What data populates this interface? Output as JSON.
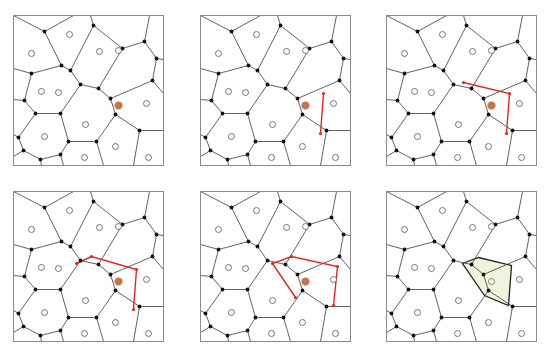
{
  "figure": {
    "panel_size": 150,
    "colors": {
      "frame": "#8a8a8a",
      "edge": "#3a3a3a",
      "vertex": "#111111",
      "site_stroke": "#555555",
      "site_fill": "#ffffff",
      "new_site_fill": "#c9794a",
      "new_site_ring": "#e8b99a",
      "trace": "#e0281e",
      "new_cell_fill": "#eef5dc",
      "new_cell_stroke": "#222222"
    }
  },
  "base": {
    "vertices": [
      [
        31,
        16
      ],
      [
        80,
        10
      ],
      [
        48,
        50
      ],
      [
        57,
        55
      ],
      [
        18,
        58
      ],
      [
        109,
        33
      ],
      [
        131,
        26
      ],
      [
        143,
        43
      ],
      [
        139,
        65
      ],
      [
        67,
        69
      ],
      [
        85,
        73
      ],
      [
        97,
        83
      ],
      [
        11,
        85
      ],
      [
        22,
        98
      ],
      [
        47,
        98
      ],
      [
        102,
        99
      ],
      [
        126,
        115
      ],
      [
        5,
        122
      ],
      [
        55,
        126
      ],
      [
        83,
        126
      ],
      [
        10,
        135
      ],
      [
        27,
        144
      ],
      [
        47,
        139
      ]
    ],
    "edges": [
      [
        [
          0,
          0
        ],
        [
          31,
          16
        ]
      ],
      [
        [
          31,
          16
        ],
        [
          60,
          0
        ]
      ],
      [
        [
          31,
          16
        ],
        [
          48,
          50
        ]
      ],
      [
        [
          80,
          10
        ],
        [
          77,
          0
        ]
      ],
      [
        [
          80,
          10
        ],
        [
          109,
          33
        ]
      ],
      [
        [
          80,
          10
        ],
        [
          57,
          55
        ]
      ],
      [
        [
          48,
          50
        ],
        [
          57,
          55
        ]
      ],
      [
        [
          48,
          50
        ],
        [
          18,
          58
        ]
      ],
      [
        [
          18,
          58
        ],
        [
          0,
          53
        ]
      ],
      [
        [
          18,
          58
        ],
        [
          11,
          85
        ]
      ],
      [
        [
          57,
          55
        ],
        [
          67,
          69
        ]
      ],
      [
        [
          67,
          69
        ],
        [
          85,
          73
        ]
      ],
      [
        [
          85,
          73
        ],
        [
          109,
          33
        ]
      ],
      [
        [
          109,
          33
        ],
        [
          131,
          26
        ]
      ],
      [
        [
          131,
          26
        ],
        [
          136,
          0
        ]
      ],
      [
        [
          131,
          26
        ],
        [
          143,
          43
        ]
      ],
      [
        [
          143,
          43
        ],
        [
          150,
          44
        ]
      ],
      [
        [
          143,
          43
        ],
        [
          139,
          65
        ]
      ],
      [
        [
          139,
          65
        ],
        [
          97,
          83
        ]
      ],
      [
        [
          139,
          65
        ],
        [
          150,
          78
        ]
      ],
      [
        [
          85,
          73
        ],
        [
          97,
          83
        ]
      ],
      [
        [
          97,
          83
        ],
        [
          102,
          99
        ]
      ],
      [
        [
          102,
          99
        ],
        [
          126,
          115
        ]
      ],
      [
        [
          126,
          115
        ],
        [
          150,
          115
        ]
      ],
      [
        [
          126,
          115
        ],
        [
          120,
          150
        ]
      ],
      [
        [
          67,
          69
        ],
        [
          47,
          98
        ]
      ],
      [
        [
          11,
          85
        ],
        [
          0,
          84
        ]
      ],
      [
        [
          11,
          85
        ],
        [
          22,
          98
        ]
      ],
      [
        [
          22,
          98
        ],
        [
          47,
          98
        ]
      ],
      [
        [
          22,
          98
        ],
        [
          5,
          122
        ]
      ],
      [
        [
          47,
          98
        ],
        [
          55,
          126
        ]
      ],
      [
        [
          55,
          126
        ],
        [
          83,
          126
        ]
      ],
      [
        [
          83,
          126
        ],
        [
          102,
          99
        ]
      ],
      [
        [
          83,
          126
        ],
        [
          90,
          150
        ]
      ],
      [
        [
          55,
          126
        ],
        [
          47,
          139
        ]
      ],
      [
        [
          47,
          139
        ],
        [
          50,
          150
        ]
      ],
      [
        [
          47,
          139
        ],
        [
          27,
          144
        ]
      ],
      [
        [
          27,
          144
        ],
        [
          10,
          135
        ]
      ],
      [
        [
          27,
          144
        ],
        [
          28,
          150
        ]
      ],
      [
        [
          10,
          135
        ],
        [
          5,
          122
        ]
      ],
      [
        [
          10,
          135
        ],
        [
          0,
          141
        ]
      ],
      [
        [
          5,
          122
        ],
        [
          0,
          119
        ]
      ]
    ],
    "sites": [
      [
        18,
        38
      ],
      [
        56,
        19
      ],
      [
        86,
        36
      ],
      [
        105,
        35
      ],
      [
        45,
        77
      ],
      [
        28,
        76
      ],
      [
        133,
        88
      ],
      [
        72,
        109
      ],
      [
        31,
        121
      ],
      [
        102,
        131
      ],
      [
        71,
        142
      ],
      [
        135,
        142
      ],
      [
        0,
        0
      ]
    ],
    "new_site": [
      105,
      90
    ]
  },
  "panels": [
    {
      "id": 1,
      "x": 13,
      "y": 15,
      "label": "step-1-insert-site",
      "trace": [],
      "new_cell": false,
      "show_new_site": true
    },
    {
      "id": 2,
      "x": 200,
      "y": 15,
      "label": "step-2-first-bisector",
      "trace": [
        [
          123,
          78
        ],
        [
          120,
          118
        ]
      ],
      "new_cell": false,
      "show_new_site": true
    },
    {
      "id": 3,
      "x": 386,
      "y": 15,
      "label": "step-3-second-bisector",
      "trace": [
        [
          77,
          67
        ],
        [
          123,
          78
        ],
        [
          120,
          118
        ]
      ],
      "new_cell": false,
      "show_new_site": true
    },
    {
      "id": 4,
      "x": 13,
      "y": 191,
      "label": "step-4-third-bisector",
      "trace": [
        [
          63,
          72
        ],
        [
          78,
          65
        ],
        [
          123,
          78
        ],
        [
          120,
          118
        ]
      ],
      "new_cell": false,
      "show_new_site": true
    },
    {
      "id": 5,
      "x": 200,
      "y": 191,
      "label": "step-5-closing-cell",
      "trace": [
        [
          95,
          106
        ],
        [
          72,
          72
        ],
        [
          91,
          65
        ],
        [
          137,
          75
        ],
        [
          133,
          114
        ]
      ],
      "new_cell": false,
      "show_new_site": true
    },
    {
      "id": 6,
      "x": 386,
      "y": 191,
      "label": "step-6-final-cell",
      "trace": [],
      "new_cell": true,
      "show_new_site": false,
      "cell_polygon": [
        [
          76,
          72
        ],
        [
          92,
          66
        ],
        [
          125,
          74
        ],
        [
          122,
          114
        ],
        [
          98,
          104
        ]
      ]
    }
  ]
}
